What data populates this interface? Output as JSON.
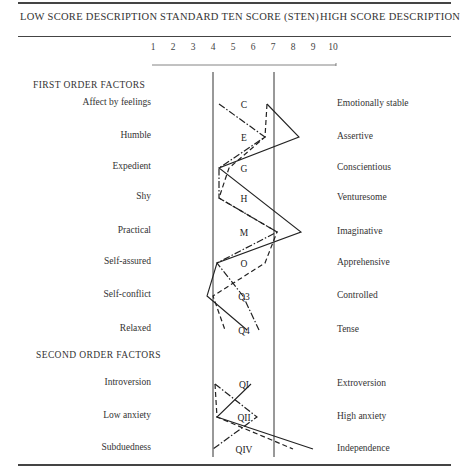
{
  "header": {
    "low_title": "LOW SCORE DESCRIPTION",
    "mid_title": "STANDARD TEN SCORE (STEN)",
    "high_title": "HIGH SCORE DESCRIPTION"
  },
  "sections": {
    "first": "FIRST ORDER FACTORS",
    "second": "SECOND ORDER FACTORS"
  },
  "rows": [
    {
      "factor": "C",
      "low": "Affect by feelings",
      "high": "Emotionally stable"
    },
    {
      "factor": "E",
      "low": "Humble",
      "high": "Assertive"
    },
    {
      "factor": "G",
      "low": "Expedient",
      "high": "Conscientious"
    },
    {
      "factor": "H",
      "low": "Shy",
      "high": "Venturesome"
    },
    {
      "factor": "M",
      "low": "Practical",
      "high": "Imaginative"
    },
    {
      "factor": "O",
      "low": "Self-assured",
      "high": "Apprehensive"
    },
    {
      "factor": "Q3",
      "low": "Self-conflict",
      "high": "Controlled"
    },
    {
      "factor": "Q4",
      "low": "Relaxed",
      "high": "Tense"
    },
    {
      "factor": "QI",
      "low": "Introversion",
      "high": "Extroversion"
    },
    {
      "factor": "QII",
      "low": "Low anxiety",
      "high": "High anxiety"
    },
    {
      "factor": "QIV",
      "low": "Subduedness",
      "high": "Independence"
    }
  ],
  "chart_data": {
    "type": "line",
    "title": "",
    "xlabel": "STANDARD TEN SCORE (STEN)",
    "ylabel": "",
    "x_ticks": [
      "1",
      "2",
      "3",
      "4",
      "5",
      "6",
      "7",
      "8",
      "9",
      "10"
    ],
    "xlim": [
      1,
      10
    ],
    "reference_lines": [
      4,
      7
    ],
    "categories": [
      "C",
      "E",
      "G",
      "H",
      "M",
      "O",
      "Q3",
      "Q4",
      "QI",
      "QII",
      "QIV"
    ],
    "groups": [
      {
        "name": "FIRST ORDER FACTORS",
        "factors": [
          "C",
          "E",
          "G",
          "H",
          "M",
          "O",
          "Q3",
          "Q4"
        ]
      },
      {
        "name": "SECOND ORDER FACTORS",
        "factors": [
          "QI",
          "QII",
          "QIV"
        ]
      }
    ],
    "series": [
      {
        "name": "Profile 1 (solid)",
        "style": "solid",
        "first_order": [
          6.7,
          8.3,
          4.3,
          null,
          8.4,
          4.2,
          3.7,
          5.7
        ],
        "second_order": [
          5.9,
          4.2,
          9.0
        ]
      },
      {
        "name": "Profile 2 (dashed)",
        "style": "dashed",
        "first_order": [
          6.7,
          6.6,
          4.8,
          4.3,
          7.2,
          6.6,
          4.0,
          4.6
        ],
        "second_order": [
          4.1,
          4.2,
          8.0
        ]
      },
      {
        "name": "Profile 3 (dash-dot)",
        "style": "dashdot",
        "first_order": [
          4.3,
          6.6,
          4.3,
          4.3,
          7.2,
          4.2,
          5.5,
          6.3
        ],
        "second_order": [
          4.1,
          6.2,
          4.0
        ]
      }
    ],
    "grid": false,
    "legend": "none"
  }
}
